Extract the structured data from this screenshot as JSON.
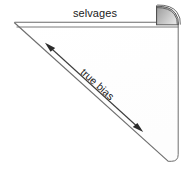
{
  "diagram": {
    "type": "fabric-bias-illustration",
    "background_color": "#ffffff",
    "labels": {
      "selvages": "selvages",
      "true_bias": "true bias"
    },
    "colors": {
      "outline": "#6e6e6e",
      "fold_fill_light": "#d4d4d4",
      "fold_fill_dark": "#8f8f8f",
      "arrow": "#2b2b2b",
      "text": "#1a1a1a"
    },
    "geometry": {
      "apex": "14,22",
      "selvage_top_y": "22",
      "selvage_bottom_y": "27",
      "right_edge_x": "178",
      "bottom_vertex": "168,162"
    },
    "annotations": {
      "selvage_label_position": "top-center",
      "bias_label_rotation_deg": "42",
      "arrow_style": "double-headed"
    }
  }
}
